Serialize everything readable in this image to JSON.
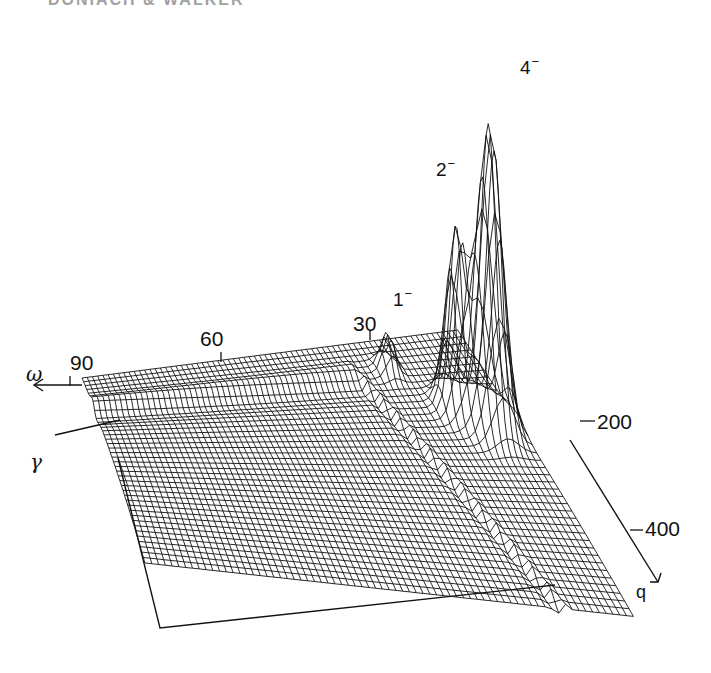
{
  "header": {
    "partial_text": "DONIACH & WALKER"
  },
  "chart_data": {
    "type": "surface3d",
    "title": "",
    "axes": {
      "omega": {
        "label": "ω",
        "ticks": [
          "90",
          "60",
          "30"
        ],
        "direction": "left/back"
      },
      "q": {
        "label": "q",
        "ticks": [
          "200",
          "400"
        ],
        "direction": "right/front"
      },
      "gamma": {
        "label": "γ"
      }
    },
    "peaks": [
      {
        "label": "1",
        "superscript": "−",
        "relative_height": 0.15
      },
      {
        "label": "2",
        "superscript": "−",
        "relative_height": 0.55
      },
      {
        "label": "4",
        "superscript": "−",
        "relative_height": 1.0
      }
    ]
  },
  "labels": {
    "omega": "ω",
    "gamma": "γ",
    "q": "q",
    "tick_90": "90",
    "tick_60": "60",
    "tick_30": "30",
    "tick_200": "200",
    "tick_400": "400",
    "peak_1": "1",
    "peak_2": "2",
    "peak_4": "4",
    "minus": "−"
  },
  "colors": {
    "ink": "#111111",
    "paper": "#ffffff"
  }
}
